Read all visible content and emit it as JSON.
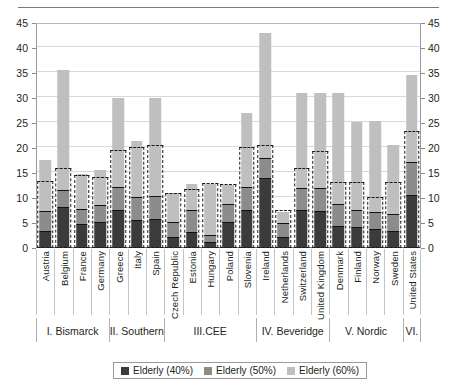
{
  "chart_data": {
    "type": "bar",
    "stacked": true,
    "title": "",
    "xlabel": "",
    "ylabel": "",
    "ylim": [
      0,
      45
    ],
    "ytick_step": 5,
    "yticks": [
      0,
      5,
      10,
      15,
      20,
      25,
      30,
      35,
      40,
      45
    ],
    "grid": true,
    "dual_axis": true,
    "legend_position": "bottom",
    "categories": [
      "Austria",
      "Belgium",
      "France",
      "Germany",
      "Greece",
      "Italy",
      "Spain",
      "Czech Republic",
      "Estonia",
      "Hungary",
      "Poland",
      "Slovenia",
      "Ireland",
      "Netherlands",
      "Switzerland",
      "United Kingdom",
      "Denmark",
      "Finland",
      "Norway",
      "Sweden",
      "United States"
    ],
    "series": [
      {
        "name": "Elderly (40%)",
        "color": "#3b3b3b",
        "values": [
          3.3,
          8.0,
          4.6,
          5.0,
          7.4,
          5.5,
          5.7,
          2.0,
          3.1,
          1.0,
          5.0,
          7.5,
          13.9,
          2.0,
          7.5,
          7.2,
          4.3,
          4.0,
          3.6,
          3.3,
          10.5
        ]
      },
      {
        "name": "Elderly (50%)",
        "color": "#8c8c8c",
        "values": [
          3.9,
          3.4,
          3.1,
          3.4,
          4.7,
          4.5,
          4.6,
          3.1,
          4.3,
          1.4,
          3.6,
          4.5,
          4.0,
          2.9,
          4.3,
          4.6,
          4.3,
          3.5,
          3.5,
          3.3,
          6.5
        ]
      },
      {
        "name": "Elderly (60%)",
        "color": "#bfbfbf",
        "values": [
          10.5,
          24.3,
          7.1,
          7.3,
          17.9,
          11.5,
          19.7,
          6.0,
          5.5,
          10.4,
          4.0,
          15.0,
          25.1,
          2.4,
          19.2,
          19.2,
          22.4,
          17.8,
          18.3,
          14.0,
          17.7
        ]
      }
    ],
    "dashed_boxes": {
      "note": "dashed outline marks the 40%+50% poverty-threshold envelope",
      "tops": [
        13.4,
        16.1,
        14.7,
        14.2,
        19.7,
        20.2,
        20.6,
        11.0,
        11.8,
        13.0,
        12.8,
        20.3,
        20.7,
        7.6,
        16.0,
        19.4,
        13.3,
        13.2,
        10.2,
        13.3,
        23.5
      ]
    },
    "totals": [
      17.7,
      35.7,
      14.8,
      15.7,
      30.0,
      21.5,
      30.0,
      11.1,
      12.9,
      12.8,
      12.6,
      27.0,
      43.0,
      7.3,
      31.0,
      31.0,
      31.0,
      25.3,
      25.4,
      20.6,
      34.7
    ],
    "groups": [
      {
        "label": "I. Bismarck",
        "count": 4
      },
      {
        "label": "II. Southern",
        "count": 3
      },
      {
        "label": "III.CEE",
        "count": 5
      },
      {
        "label": "IV. Beveridge",
        "count": 4
      },
      {
        "label": "V. Nordic",
        "count": 4
      },
      {
        "label": "VI.",
        "count": 1
      }
    ],
    "legend": [
      {
        "label": "Elderly (40%)",
        "color": "#3b3b3b"
      },
      {
        "label": "Elderly (50%)",
        "color": "#8c8c8c"
      },
      {
        "label": "Elderly (60%)",
        "color": "#bfbfbf"
      }
    ]
  }
}
